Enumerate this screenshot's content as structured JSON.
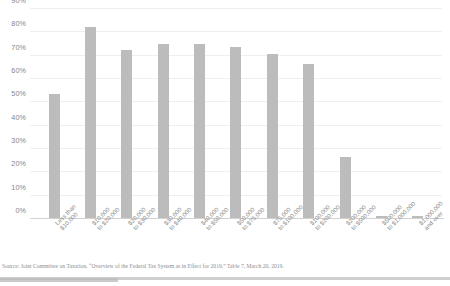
{
  "chart_data": {
    "type": "bar",
    "title": "",
    "xlabel": "",
    "ylabel": "",
    "ylim": [
      0,
      90
    ],
    "grid": true,
    "legend": "none",
    "ytick_labels": [
      "90%",
      "80%",
      "70%",
      "60%",
      "50%",
      "40%",
      "30%",
      "20%",
      "10%",
      "0%"
    ],
    "ytick_values": [
      90,
      80,
      70,
      60,
      50,
      40,
      30,
      20,
      10,
      0
    ],
    "categories": [
      "Less than $10,000",
      "$10,000 to $20,000",
      "$20,000 to $30,000",
      "$30,000 to $40,000",
      "$40,000 to $50,000",
      "$50,000 to $75,000",
      "$75,000 to $100,000",
      "$100,000 to $200,000",
      "$200,000 to $500,000",
      "$500,000 to $1,000,000",
      "$1,000,000 and over"
    ],
    "category_lines": [
      [
        "Less than",
        "$10,000"
      ],
      [
        "$10,000",
        "to $20,000"
      ],
      [
        "$20,000",
        "to $30,000"
      ],
      [
        "$30,000",
        "to $40,000"
      ],
      [
        "$40,000",
        "to $50,000"
      ],
      [
        "$50,000",
        "to $75,000"
      ],
      [
        "$75,000",
        "to $100,000"
      ],
      [
        "$100,000",
        "to $200,000"
      ],
      [
        "$200,000",
        "to $500,000"
      ],
      [
        "$500,000",
        "to $1,000,000"
      ],
      [
        "$1,000,000",
        "and over"
      ]
    ],
    "values": [
      53,
      82,
      72,
      74.5,
      74.5,
      73.5,
      70.5,
      66,
      26,
      1,
      1
    ],
    "bar_color": "#bcbcbc"
  },
  "notes": {
    "source": "Source: Joint Committee on Taxation, “Overview of the Federal Tax System as in Effect for 2019,” Table 7, March 20, 2019."
  }
}
